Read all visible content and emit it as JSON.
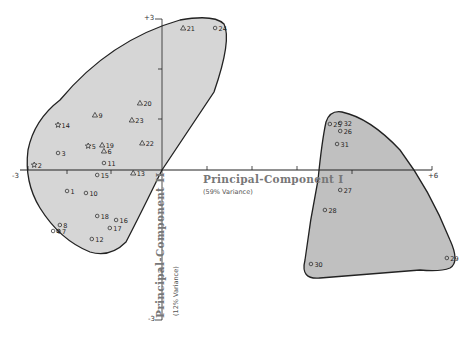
{
  "chart_data": {
    "type": "scatter",
    "title": "",
    "xlabel": "Principal-Component I",
    "xlabel_sub": "(59% Variance)",
    "ylabel": "Principal-Component II",
    "ylabel_sub": "(12% Variance)",
    "xlim": [
      -3,
      6
    ],
    "ylim": [
      -3,
      3
    ],
    "x_tick_labels": [
      "-3",
      "+6"
    ],
    "y_tick_labels": [
      "+3",
      "-3"
    ],
    "grid": false,
    "legend": null,
    "symbols": {
      "circle": "o",
      "triangle": "△",
      "star": "☆"
    },
    "groups": [
      {
        "name": "Group A (left cluster)",
        "fill": "#d4d4d4",
        "points": [
          {
            "id": "1",
            "x": -2.11,
            "y": -0.42,
            "marker": "circle"
          },
          {
            "id": "2",
            "x": -2.84,
            "y": 0.1,
            "marker": "star"
          },
          {
            "id": "3",
            "x": -2.31,
            "y": 0.34,
            "marker": "circle"
          },
          {
            "id": "4",
            "x": -2.42,
            "y": -1.22,
            "marker": "circle"
          },
          {
            "id": "5",
            "x": -1.64,
            "y": 0.48,
            "marker": "star"
          },
          {
            "id": "6",
            "x": -1.29,
            "y": 0.38,
            "marker": "triangle"
          },
          {
            "id": "7",
            "x": -2.3,
            "y": -1.22,
            "marker": "circle"
          },
          {
            "id": "8",
            "x": -2.27,
            "y": -1.1,
            "marker": "circle"
          },
          {
            "id": "9",
            "x": -1.49,
            "y": 1.1,
            "marker": "triangle"
          },
          {
            "id": "10",
            "x": -1.69,
            "y": -0.46,
            "marker": "circle"
          },
          {
            "id": "11",
            "x": -1.29,
            "y": 0.14,
            "marker": "circle"
          },
          {
            "id": "12",
            "x": -1.56,
            "y": -1.38,
            "marker": "circle"
          },
          {
            "id": "13",
            "x": -0.64,
            "y": -0.06,
            "marker": "triangle"
          },
          {
            "id": "14",
            "x": -2.31,
            "y": 0.9,
            "marker": "star"
          },
          {
            "id": "15",
            "x": -1.44,
            "y": -0.1,
            "marker": "circle"
          },
          {
            "id": "16",
            "x": -1.02,
            "y": -1.0,
            "marker": "circle"
          },
          {
            "id": "17",
            "x": -1.16,
            "y": -1.16,
            "marker": "circle"
          },
          {
            "id": "18",
            "x": -1.44,
            "y": -0.92,
            "marker": "circle"
          },
          {
            "id": "19",
            "x": -1.33,
            "y": 0.5,
            "marker": "triangle"
          },
          {
            "id": "20",
            "x": -0.49,
            "y": 1.34,
            "marker": "triangle"
          },
          {
            "id": "21",
            "x": 0.47,
            "y": 2.84,
            "marker": "triangle"
          },
          {
            "id": "22",
            "x": -0.44,
            "y": 0.54,
            "marker": "triangle"
          },
          {
            "id": "23",
            "x": -0.67,
            "y": 1.0,
            "marker": "triangle"
          },
          {
            "id": "24",
            "x": 1.18,
            "y": 2.84,
            "marker": "circle"
          }
        ]
      },
      {
        "name": "Group B (right cluster)",
        "fill": "#bdbdbd",
        "points": [
          {
            "id": "25",
            "x": 3.73,
            "y": 0.92,
            "marker": "circle"
          },
          {
            "id": "26",
            "x": 3.96,
            "y": 0.78,
            "marker": "circle"
          },
          {
            "id": "27",
            "x": 3.96,
            "y": -0.4,
            "marker": "circle"
          },
          {
            "id": "28",
            "x": 3.62,
            "y": -0.8,
            "marker": "circle"
          },
          {
            "id": "29",
            "x": 6.33,
            "y": -1.76,
            "marker": "circle"
          },
          {
            "id": "30",
            "x": 3.31,
            "y": -1.88,
            "marker": "circle"
          },
          {
            "id": "31",
            "x": 3.89,
            "y": 0.52,
            "marker": "circle"
          },
          {
            "id": "32",
            "x": 3.96,
            "y": 0.94,
            "marker": "circle"
          }
        ]
      }
    ]
  }
}
